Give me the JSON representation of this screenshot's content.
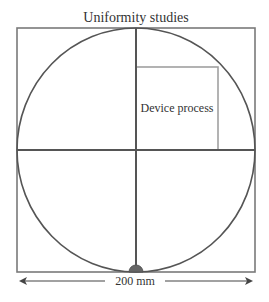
{
  "diagram": {
    "title": "Uniformity studies",
    "inner_label": "Device process",
    "dimension_label": "200 mm",
    "colors": {
      "outer_square": "#7a7a7a",
      "circle": "#555555",
      "midlines": "#555555",
      "inner_box": "#a0a0a0",
      "notch": "#666666",
      "text": "#333333"
    }
  }
}
